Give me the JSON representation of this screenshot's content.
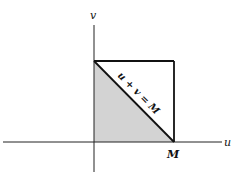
{
  "diagram": {
    "axes": {
      "x_label": "u",
      "y_label": "v"
    },
    "square": {
      "side_label": "M"
    },
    "diagonal": {
      "equation": "u + v = M"
    },
    "region": {
      "description": "triangle 0 ≤ u, 0 ≤ v, u + v ≤ M",
      "fill_color": "#d3d3d3"
    },
    "colors": {
      "line": "#111111",
      "background": "#ffffff"
    }
  }
}
